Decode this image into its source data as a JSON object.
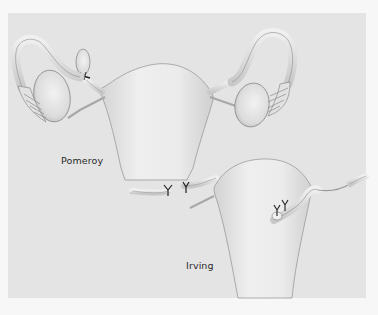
{
  "figure": {
    "labels": {
      "pomeroy": "Pomeroy",
      "irving": "Irving"
    },
    "colors": {
      "page_background": "#f7f7f7",
      "panel_background": "#e4e4e4",
      "tissue_fill": "#ececec",
      "tissue_shade": "#c9c9c9",
      "outline": "#8a8a8a",
      "suture": "#222222",
      "label_text": "#2a2a2a"
    }
  }
}
